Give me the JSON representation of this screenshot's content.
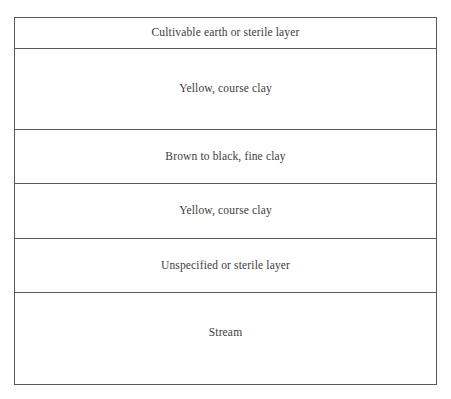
{
  "diagram": {
    "name": "stratigraphic-profile",
    "background_color": "#ffffff",
    "border_color": "#5a5a5a",
    "text_color": "#3c3c3c",
    "layers": [
      {
        "index": 1,
        "label": "Cultivable earth or sterile layer",
        "height_px": 31
      },
      {
        "index": 2,
        "label": "Yellow, course clay",
        "height_px": 82
      },
      {
        "index": 3,
        "label": "Brown to black, fine clay",
        "height_px": 54
      },
      {
        "index": 4,
        "label": "Yellow, course clay",
        "height_px": 55
      },
      {
        "index": 5,
        "label": "Unspecified or sterile layer",
        "height_px": 55
      },
      {
        "index": 6,
        "label": "Stream",
        "height_px": 91
      }
    ]
  }
}
